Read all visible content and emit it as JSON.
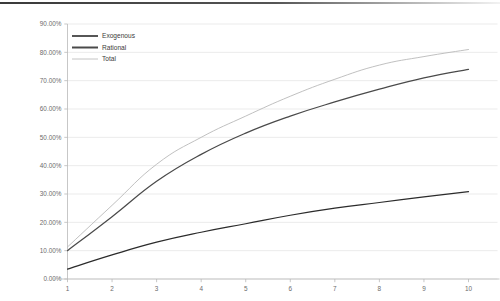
{
  "chart_data": {
    "type": "line",
    "title": "",
    "subtitle": "",
    "xlabel": "",
    "ylabel": "",
    "x": [
      1,
      2,
      3,
      4,
      5,
      6,
      7,
      8,
      9,
      10
    ],
    "xtick_labels": [
      "1",
      "2",
      "3",
      "4",
      "5",
      "6",
      "7",
      "8",
      "9",
      "10"
    ],
    "ytick_labels": [
      "0.00%",
      "10.00%",
      "20.00%",
      "30.00%",
      "40.00%",
      "50.00%",
      "60.00%",
      "70.00%",
      "80.00%",
      "90.00%"
    ],
    "ytick_values": [
      0,
      10,
      20,
      30,
      40,
      50,
      60,
      70,
      80,
      90
    ],
    "ylim": [
      0,
      90
    ],
    "xlim": [
      1,
      10
    ],
    "grid": "horizontal",
    "legend_position": "top-left-inside",
    "series": [
      {
        "name": "Exogenous",
        "color": "#2b2b2b",
        "width": 1.25,
        "values": [
          3.5,
          8.5,
          13.0,
          16.5,
          19.5,
          22.5,
          25.0,
          27.0,
          29.0,
          30.8
        ]
      },
      {
        "name": "Rational",
        "color": "#4a4a4a",
        "width": 1.25,
        "values": [
          10.0,
          22.0,
          34.5,
          44.0,
          51.5,
          57.5,
          62.5,
          67.0,
          71.0,
          74.0
        ]
      },
      {
        "name": "Total",
        "color": "#b9b9b9",
        "width": 0.9,
        "values": [
          11.3,
          26.0,
          40.5,
          50.0,
          57.5,
          64.5,
          70.5,
          75.5,
          78.5,
          81.0
        ]
      }
    ],
    "legend": [
      {
        "label": "Exogenous",
        "color": "#2b2b2b",
        "width": 1.6
      },
      {
        "label": "Rational",
        "color": "#4a4a4a",
        "width": 2.0
      },
      {
        "label": "Total",
        "color": "#bdbdbd",
        "width": 0.9
      }
    ],
    "colors": {
      "grid": "#e2e2e2",
      "axis": "#b9b9b9",
      "tick_text": "#6b6b6b",
      "legend_text": "#3b3b3b",
      "background": "#ffffff"
    }
  }
}
